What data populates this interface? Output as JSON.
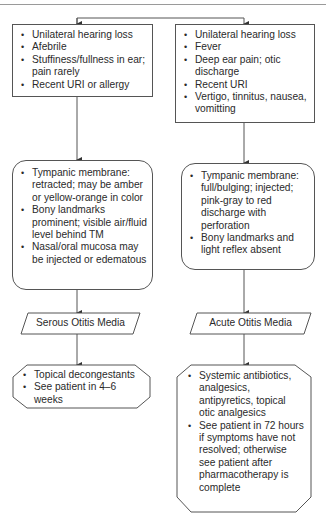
{
  "header": {
    "text": "Section  ···"
  },
  "diagram": {
    "type": "flowchart",
    "left_branch": {
      "findings": [
        "Unilateral hearing loss",
        "Afebrile",
        "Stuffiness/fullness in ear; pain rarely",
        "Recent URI or allergy"
      ],
      "exam": [
        "Tympanic membrane: retracted; may be amber or yellow-orange in color",
        "Bony landmarks prominent; visible air/fluid level behind TM",
        "Nasal/oral mucosa may be injected or edematous"
      ],
      "diagnosis": "Serous Otitis Media",
      "treatment": [
        "Topical decongestants",
        "See patient in 4–6 weeks"
      ]
    },
    "right_branch": {
      "findings": [
        "Unilateral hearing loss",
        "Fever",
        "Deep ear pain; otic discharge",
        "Recent URI",
        "Vertigo, tinnitus, nausea, vomitting"
      ],
      "exam": [
        "Tympanic membrane: full/bulging; injected; pink-gray to red discharge with perforation",
        "Bony landmarks and light reflex absent"
      ],
      "diagnosis": "Acute Otitis Media",
      "treatment": [
        "Systemic antibiotics, analgesics, antipyretics, topical otic analgesics",
        "See patient in 72 hours if symptoms have not resolved; otherwise see patient after pharmacotherapy is complete"
      ]
    }
  }
}
